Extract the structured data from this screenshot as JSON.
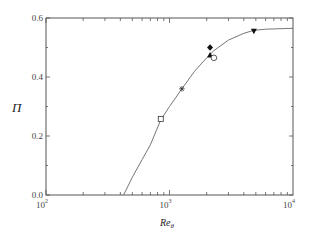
{
  "chart_data": {
    "type": "scatter",
    "title": "",
    "xlabel": "Re_θ",
    "xlabel_main": "Re",
    "xlabel_sub": "θ",
    "ylabel": "Π",
    "xscale": "log",
    "xlim": [
      100,
      10000
    ],
    "ylim": [
      0.0,
      0.6
    ],
    "grid": false,
    "legend": null,
    "x_ticks": [
      {
        "value": 100,
        "base": "10",
        "exp": "2"
      },
      {
        "value": 1000,
        "base": "10",
        "exp": "3"
      },
      {
        "value": 10000,
        "base": "10",
        "exp": "4"
      }
    ],
    "y_ticks": [
      {
        "value": 0.0,
        "label": "0.0"
      },
      {
        "value": 0.2,
        "label": "0.2"
      },
      {
        "value": 0.4,
        "label": "0.4"
      },
      {
        "value": 0.6,
        "label": "0.6"
      }
    ],
    "curve": {
      "name": "fit",
      "style": "solid line",
      "points": [
        [
          425,
          0.0
        ],
        [
          500,
          0.06
        ],
        [
          600,
          0.12
        ],
        [
          700,
          0.17
        ],
        [
          850,
          0.255
        ],
        [
          1000,
          0.3
        ],
        [
          1260,
          0.36
        ],
        [
          1600,
          0.42
        ],
        [
          2000,
          0.465
        ],
        [
          2300,
          0.49
        ],
        [
          3000,
          0.525
        ],
        [
          4000,
          0.548
        ],
        [
          4800,
          0.558
        ],
        [
          6000,
          0.562
        ],
        [
          10000,
          0.565
        ]
      ]
    },
    "series": [
      {
        "name": "square",
        "marker": "open-square",
        "x": 850,
        "y": 0.258
      },
      {
        "name": "asterisk",
        "marker": "asterisk",
        "x": 1260,
        "y": 0.36
      },
      {
        "name": "diamond",
        "marker": "filled-diamond",
        "x": 2130,
        "y": 0.5
      },
      {
        "name": "triangle",
        "marker": "filled-triangle-up",
        "x": 2130,
        "y": 0.475
      },
      {
        "name": "circle",
        "marker": "open-circle",
        "x": 2290,
        "y": 0.465
      },
      {
        "name": "inverted-triangle",
        "marker": "filled-triangle-down",
        "x": 4820,
        "y": 0.555
      }
    ]
  }
}
